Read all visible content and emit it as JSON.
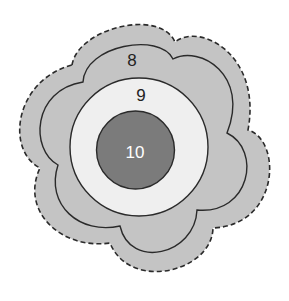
{
  "diagram": {
    "type": "nested-regions",
    "colors": {
      "background": "#ffffff",
      "outer_fill": "#c4c4c4",
      "ring_fill": "#efefef",
      "core_fill": "#7b7b7b",
      "stroke": "#2a2a2a",
      "label_dark": "#222222",
      "label_light": "#ffffff"
    },
    "regions": [
      {
        "id": "outer",
        "label": "8",
        "boundary": "dashed flower outline with inner solid scalloped line"
      },
      {
        "id": "ring",
        "label": "9",
        "boundary": "solid circle"
      },
      {
        "id": "core",
        "label": "10",
        "boundary": "solid circle"
      }
    ]
  }
}
